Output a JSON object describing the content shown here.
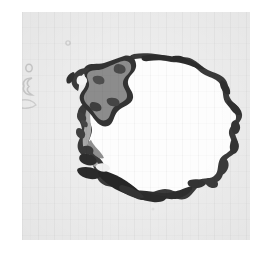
{
  "figure": {
    "kind": "scanned-map",
    "projection_hint": "polar-stereographic",
    "caption": "",
    "title": "",
    "labels": [],
    "has_visible_text": false
  },
  "page": {
    "background_color": "#ffffff",
    "margin_left": 22,
    "margin_top": 12
  },
  "panel": {
    "x": 22,
    "y": 12,
    "width": 228,
    "height": 228,
    "ocean_color": "#ececec",
    "texture": "jpeg-block-scan-noise"
  },
  "palette": {
    "ocean": "#ececec",
    "ice_sheet_white": "#fdfdfd",
    "coast_outline_dark": "#3a3a3a",
    "coast_outline_darkest": "#222222",
    "ice_shelf_grey": "#8c8c8c",
    "ice_shelf_grey_light": "#a8a8a8",
    "island_outline_faint": "#b9b9b9"
  },
  "regions": [
    {
      "name": "main-ice-sheet",
      "role": "continental interior",
      "fill": "#fdfdfd",
      "description": "Large white rounded landmass occupying the center of the panel"
    },
    {
      "name": "coast-outline",
      "role": "continental coastline",
      "fill": "#3a3a3a",
      "description": "Jagged dark coastal rim tracing the ice sheet perimeter"
    },
    {
      "name": "ronne-filchner-ice-shelf",
      "role": "ice shelf",
      "fill": "#8c8c8c",
      "description": "Medium grey lobed shelf in the upper-left of the continent"
    },
    {
      "name": "antarctic-peninsula",
      "role": "peninsula",
      "fill": "#8c8c8c",
      "description": "Narrow arm extending to the upper left"
    },
    {
      "name": "ross-ice-shelf-coast",
      "role": "ice shelf / coast",
      "fill": "#3a3a3a",
      "description": "Elongated dark patches along the lower-left coast"
    },
    {
      "name": "west-coast-shading",
      "role": "shelf shading",
      "fill": "#a8a8a8",
      "description": "Grey shading band along the western coastal margin"
    }
  ],
  "marks": [
    {
      "name": "island-mark-upper-left",
      "shape": "tiny-ring",
      "x": 6,
      "y": 55,
      "color": "#b9b9b9"
    },
    {
      "name": "island-mark-left-outline",
      "shape": "small-open-curve",
      "x": 2,
      "y": 72,
      "color": "#b9b9b9"
    },
    {
      "name": "speck-mark-top",
      "shape": "tiny-dot",
      "x": 45,
      "y": 31,
      "color": "#c4c4c4"
    },
    {
      "name": "speck-mark-lower",
      "shape": "tiny-dot",
      "x": 130,
      "y": 196,
      "color": "#d8d8d8"
    }
  ]
}
